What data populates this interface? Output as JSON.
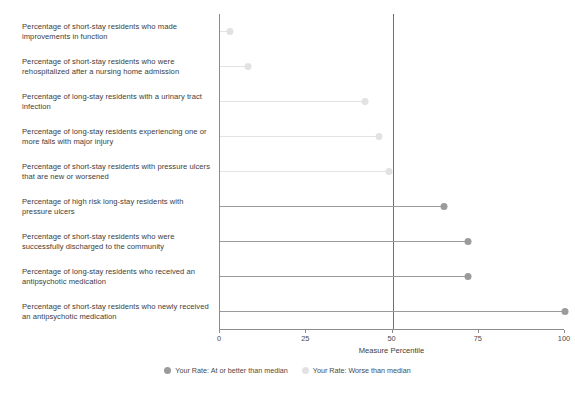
{
  "chart_data": {
    "type": "bar",
    "subtype": "lollipop-horizontal",
    "title": "",
    "xlabel": "Measure Percentile",
    "ylabel": "",
    "xlim": [
      0,
      100
    ],
    "xticks": [
      0,
      25,
      50,
      75,
      100
    ],
    "xticklabels": [
      "0",
      "25",
      "50",
      "75",
      "100"
    ],
    "grid": false,
    "reference_line": 50,
    "legend_position": "bottom",
    "categories": [
      "Percentage of short-stay residents who made improvements in function",
      "Percentage of short-stay residents who were rehospitalized after a nursing home admission",
      "Percentage of long-stay residents with a urinary tract infection",
      "Percentage of long-stay residents experiencing one or more falls with major injury",
      "Percentage of short-stay residents with pressure ulcers that are new or worsened",
      "Percentage of high risk long-stay residents with pressure ulcers",
      "Percentage of short-stay residents who were successfully discharged to the community",
      "Percentage of long-stay residents who received an antipsychotic medication",
      "Percentage of short-stay residents who newly received an antipsychotic medication"
    ],
    "values": [
      3,
      8,
      42,
      46,
      49,
      65,
      72,
      72,
      100
    ],
    "point_groups": [
      "worse",
      "worse",
      "worse",
      "worse",
      "worse",
      "better",
      "better",
      "better",
      "better"
    ],
    "series": [
      {
        "name": "Your Rate: At or better than median",
        "color": "#9b9b9b"
      },
      {
        "name": "Your Rate: Worse than median",
        "color": "#e2e2e2"
      }
    ]
  },
  "legend": {
    "items": [
      {
        "label": "Your Rate: At or better than median",
        "color": "#9b9b9b"
      },
      {
        "label": "Your Rate: Worse than median",
        "color": "#e2e2e2"
      }
    ]
  },
  "axis": {
    "x_title": "Measure Percentile"
  },
  "colors": {
    "better": "#9b9b9b",
    "worse": "#e2e2e2",
    "axis": "#8c8c8c",
    "refline": "#6f6f6f",
    "text": "#3d3d3d",
    "background": "#ffffff"
  }
}
